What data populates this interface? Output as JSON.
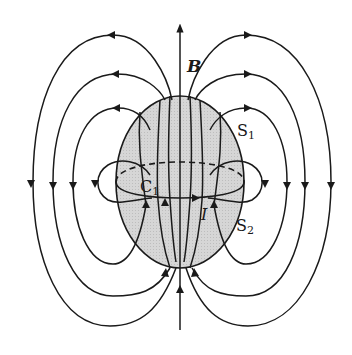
{
  "figure": {
    "colors": {
      "line": "#1a1a1a",
      "sphere_fill": "#d4d4d4",
      "background": "#ffffff"
    },
    "labels": {
      "field": "B",
      "surface_1": "S",
      "surface_1_sub": "1",
      "surface_2": "S",
      "surface_2_sub": "2",
      "contour": "C",
      "contour_sub": "1",
      "current": "I"
    }
  }
}
